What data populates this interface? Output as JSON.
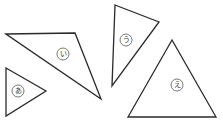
{
  "diagram": {
    "type": "geometry-shapes",
    "shapes": [
      {
        "id": "a",
        "label": "あ",
        "kind": "triangle",
        "points": "6,68 46,91 6,116",
        "label_pos": [
          18,
          91
        ]
      },
      {
        "id": "i",
        "label": "い",
        "kind": "triangle",
        "points": "6,34 75,33 101,99",
        "label_pos": [
          63,
          54
        ]
      },
      {
        "id": "u",
        "label": "う",
        "kind": "triangle",
        "points": "115,5 159,22 112,86",
        "label_pos": [
          126,
          40
        ]
      },
      {
        "id": "e",
        "label": "え",
        "kind": "triangle",
        "points": "172,40 128,117 216,117",
        "label_pos": [
          177,
          85
        ]
      }
    ]
  }
}
